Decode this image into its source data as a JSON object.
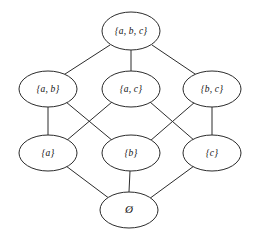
{
  "diagram": {
    "kind": "hasse-diagram",
    "canvas": {
      "width": 258,
      "height": 235,
      "background": "#ffffff"
    },
    "style": {
      "node_fill": "#ffffff",
      "node_stroke": "#2b2b2b",
      "edge_stroke": "#2b2b2b",
      "label_color": "#111111",
      "stroke_width": 1,
      "node_rx": 29,
      "node_ry": 19
    },
    "nodes": [
      {
        "id": "abc",
        "label": "{a, b, c}",
        "cx": 131,
        "cy": 31,
        "rx": 29,
        "ry": 19,
        "level": 3
      },
      {
        "id": "ab",
        "label": "{a, b}",
        "cx": 48,
        "cy": 89,
        "rx": 29,
        "ry": 18,
        "level": 2
      },
      {
        "id": "ac",
        "label": "{a, c}",
        "cx": 131,
        "cy": 89,
        "rx": 29,
        "ry": 18,
        "level": 2
      },
      {
        "id": "bc",
        "label": "{b, c}",
        "cx": 212,
        "cy": 89,
        "rx": 29,
        "ry": 18,
        "level": 2
      },
      {
        "id": "a",
        "label": "{a}",
        "cx": 48,
        "cy": 153,
        "rx": 29,
        "ry": 18,
        "level": 1
      },
      {
        "id": "b",
        "label": "{b}",
        "cx": 131,
        "cy": 153,
        "rx": 29,
        "ry": 18,
        "level": 1
      },
      {
        "id": "c",
        "label": "{c}",
        "cx": 212,
        "cy": 153,
        "rx": 29,
        "ry": 18,
        "level": 1
      },
      {
        "id": "empty",
        "label": "Ø",
        "cx": 129,
        "cy": 210,
        "rx": 29,
        "ry": 18,
        "level": 0
      }
    ],
    "edges": [
      {
        "id": "abc-ab",
        "from": "abc",
        "to": "ab",
        "x1": 110,
        "y1": 45,
        "x2": 62,
        "y2": 76
      },
      {
        "id": "abc-ac",
        "from": "abc",
        "to": "ac",
        "x1": 131,
        "y1": 50,
        "x2": 131,
        "y2": 71
      },
      {
        "id": "abc-bc",
        "from": "abc",
        "to": "bc",
        "x1": 152,
        "y1": 45,
        "x2": 198,
        "y2": 76
      },
      {
        "id": "ab-a",
        "from": "ab",
        "to": "a",
        "x1": 48,
        "y1": 107,
        "x2": 48,
        "y2": 135
      },
      {
        "id": "ab-b",
        "from": "ab",
        "to": "b",
        "x1": 66,
        "y1": 102,
        "x2": 113,
        "y2": 141
      },
      {
        "id": "ac-a",
        "from": "ac",
        "to": "a",
        "x1": 112,
        "y1": 102,
        "x2": 66,
        "y2": 141
      },
      {
        "id": "ac-c",
        "from": "ac",
        "to": "c",
        "x1": 150,
        "y1": 102,
        "x2": 195,
        "y2": 141
      },
      {
        "id": "bc-b",
        "from": "bc",
        "to": "b",
        "x1": 195,
        "y1": 102,
        "x2": 150,
        "y2": 141
      },
      {
        "id": "bc-c",
        "from": "bc",
        "to": "c",
        "x1": 212,
        "y1": 107,
        "x2": 212,
        "y2": 135
      },
      {
        "id": "a-empty",
        "from": "a",
        "to": "empty",
        "x1": 66,
        "y1": 166,
        "x2": 110,
        "y2": 199
      },
      {
        "id": "b-empty",
        "from": "b",
        "to": "empty",
        "x1": 130,
        "y1": 171,
        "x2": 129,
        "y2": 192
      },
      {
        "id": "c-empty",
        "from": "c",
        "to": "empty",
        "x1": 194,
        "y1": 166,
        "x2": 149,
        "y2": 199
      }
    ]
  }
}
